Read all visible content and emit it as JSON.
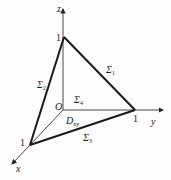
{
  "axes": {
    "x": {
      "label": "x",
      "tick": "1"
    },
    "y": {
      "label": "y",
      "tick": "1"
    },
    "z": {
      "label": "z",
      "tick": "1"
    },
    "origin": "O"
  },
  "surfaces": {
    "s1": {
      "symbol": "Σ",
      "sub": "1"
    },
    "s2": {
      "symbol": "Σ",
      "sub": "2"
    },
    "s3": {
      "symbol": "Σ",
      "sub": "3"
    },
    "s4": {
      "symbol": "Σ",
      "sub": "4"
    }
  },
  "region": {
    "symbol": "D",
    "sub": "xy"
  },
  "colors": {
    "line": "#1a1a1a",
    "thin": "#555555"
  }
}
